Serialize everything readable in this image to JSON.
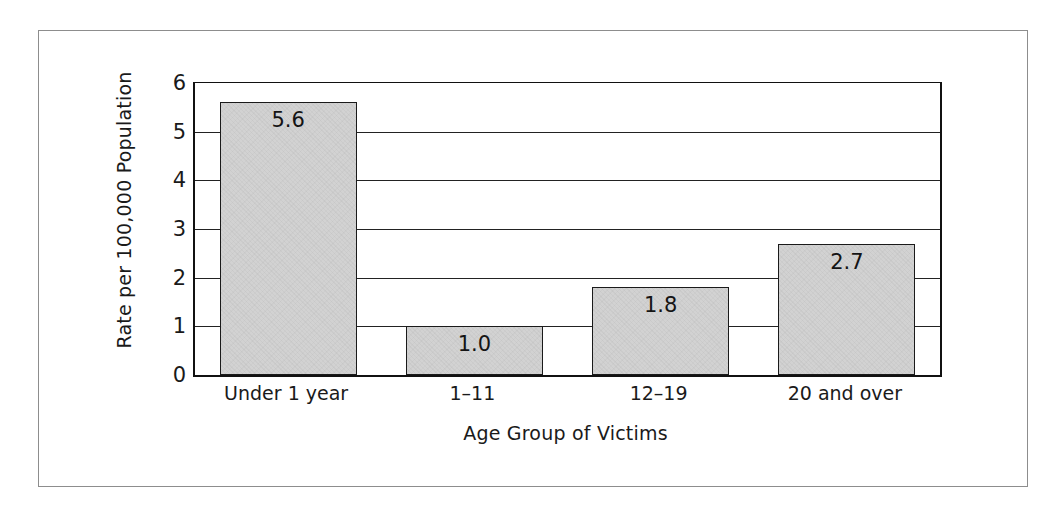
{
  "figure": {
    "has_outer_frame": true,
    "background_color": "#ffffff",
    "bar_fill_color": "#d2d2d2",
    "bar_border_color": "#1a1a1a",
    "axis_color": "#111111"
  },
  "chart_data": {
    "type": "bar",
    "title": "",
    "xlabel": "Age Group of Victims",
    "ylabel": "Rate per 100,000 Population",
    "categories": [
      "Under 1 year",
      "1–11",
      "12–19",
      "20 and over"
    ],
    "values": [
      5.6,
      1.0,
      1.8,
      2.7
    ],
    "value_labels": [
      "5.6",
      "1.0",
      "1.8",
      "2.7"
    ],
    "ylim": [
      0,
      6
    ],
    "yticks": [
      0,
      1,
      2,
      3,
      4,
      5,
      6
    ],
    "ytick_labels": [
      "0",
      "1",
      "2",
      "3",
      "4",
      "5",
      "6"
    ],
    "grid": true,
    "grid_axis": "y",
    "legend": false,
    "legend_position": "none",
    "label_position": "inside-top"
  }
}
